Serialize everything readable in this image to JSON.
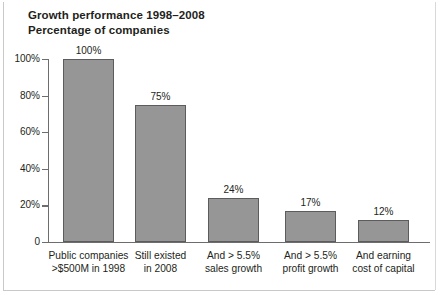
{
  "chart_data": {
    "type": "bar",
    "title": "Growth performance 1998–2008",
    "subtitle": "Percentage of companies",
    "xlabel": "",
    "ylabel": "Percentage of companies",
    "ylim": [
      0,
      100
    ],
    "grid": false,
    "legend": "none",
    "categories": [
      "Public companies >$500M in 1998",
      "Still existed in 2008",
      "And > 5.5% sales growth",
      "And > 5.5% profit growth",
      "And earning cost of capital"
    ],
    "category_lines": [
      [
        "Public companies",
        ">$500M in 1998"
      ],
      [
        "Still existed",
        "in 2008"
      ],
      [
        "And > 5.5%",
        "sales growth"
      ],
      [
        "And > 5.5%",
        "profit growth"
      ],
      [
        "And earning",
        "cost of capital"
      ]
    ],
    "values": [
      100,
      75,
      24,
      17,
      12
    ],
    "value_labels": [
      "100%",
      "75%",
      "24%",
      "17%",
      "12%"
    ],
    "ytick_values": [
      100,
      80,
      60,
      40,
      20,
      0
    ],
    "ytick_labels": [
      "100%",
      "80%",
      "60%",
      "40%",
      "20%",
      "0"
    ],
    "colors": {
      "bar_fill": "#969696",
      "bar_stroke": "#5c5c5c",
      "axis": "#6d6d6d",
      "text": "#231f20",
      "background": "#ffffff"
    }
  }
}
